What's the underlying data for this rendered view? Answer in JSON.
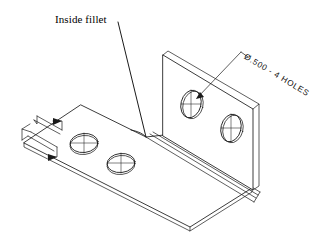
{
  "drawing": {
    "type": "isometric-technical-drawing",
    "subject": "sheet metal L-bracket",
    "background_color": "#ffffff",
    "line_color": "#1a1a1a"
  },
  "annotations": {
    "inside_fillet": {
      "text": "Inside fillet",
      "leader_from": [
        118,
        22
      ],
      "leader_to": [
        146,
        137
      ]
    },
    "hole_note": {
      "text": "Ø.500 - 4 HOLES",
      "rotation_deg": 31,
      "leader_from": [
        248,
        57
      ],
      "leader_to": [
        197,
        98
      ]
    }
  },
  "features": {
    "holes": [
      {
        "name": "hole-top-face-left",
        "cx": 84,
        "cy": 143,
        "rx": 14,
        "ry": 9.5
      },
      {
        "name": "hole-top-face-right",
        "cx": 121,
        "cy": 163,
        "rx": 14,
        "ry": 9.5
      },
      {
        "name": "hole-flange-upper",
        "cx": 191,
        "cy": 104,
        "rx": 10,
        "ry": 14
      },
      {
        "name": "hole-flange-lower",
        "cx": 231,
        "cy": 128,
        "rx": 10,
        "ry": 14
      }
    ],
    "section_arrows": [
      {
        "name": "section-arrow-upper"
      },
      {
        "name": "section-arrow-lower"
      }
    ]
  }
}
